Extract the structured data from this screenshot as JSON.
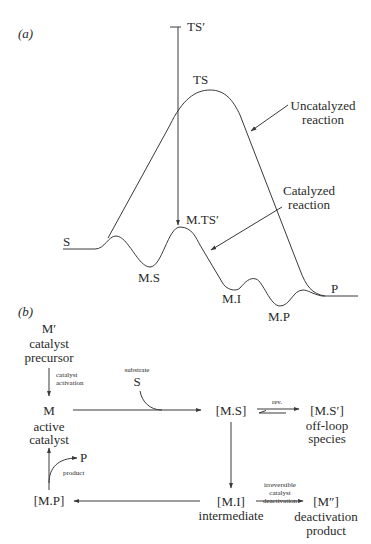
{
  "panel_a": {
    "label": "(a)",
    "ts_prime": "TS′",
    "ts": "TS",
    "s": "S",
    "ms": "M.S",
    "mts_prime": "M.TS′",
    "mi": "M.I",
    "mp": "M.P",
    "p": "P",
    "uncatalyzed_line1": "Uncatalyzed",
    "uncatalyzed_line2": "reaction",
    "catalyzed_line1": "Catalyzed",
    "catalyzed_line2": "reaction"
  },
  "panel_b": {
    "label": "(b)",
    "m_prime": "M′",
    "m_prime_desc1": "catalyst",
    "m_prime_desc2": "precursor",
    "activation1": "catalyst",
    "activation2": "activation",
    "m": "M",
    "m_desc1": "active",
    "m_desc2": "catalyst",
    "substrate_label": "substrate",
    "substrate": "S",
    "ms": "[M.S]",
    "rev": "rev.",
    "ms_prime": "[M.S′]",
    "ms_prime_desc1": "off-loop",
    "ms_prime_desc2": "species",
    "mi": "[M.I]",
    "mi_desc": "intermediate",
    "deact1": "irreversible",
    "deact2": "catalyst",
    "deact3": "deactivation",
    "m_dprime": "[M″]",
    "m_dprime_desc1": "deactivation",
    "m_dprime_desc2": "product",
    "mp": "[M.P]",
    "product_p": "P",
    "product_label": "product"
  }
}
